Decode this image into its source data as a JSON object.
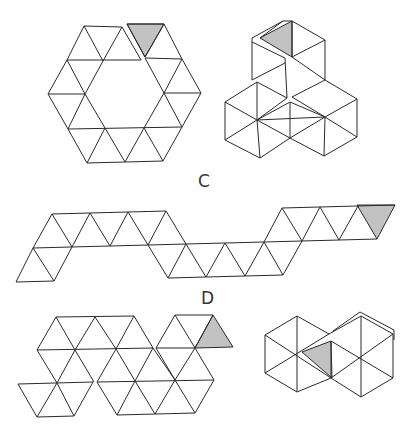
{
  "figure": {
    "labels": {
      "c": "C",
      "d": "D"
    },
    "colors": {
      "line": "#2a2a2a",
      "shaded_face": "#c2c2c2",
      "background": "#ffffff"
    },
    "panels": [
      {
        "id": "C-net",
        "description": "hexagonal ring of 18 equilateral triangles with one shaded triangle at top"
      },
      {
        "id": "C-folded",
        "description": "folded 3D model: three cubes-like rhombic stack with one shaded face"
      },
      {
        "id": "D-net-strip",
        "description": "zigzag strip of equilateral triangles with one shaded triangle at right end"
      },
      {
        "id": "D-net",
        "description": "compact net of triangles forming two hexagon-like clusters with one shaded triangle"
      },
      {
        "id": "D-folded",
        "description": "folded 3D model: two adjoining hexagons with one shaded triangle"
      }
    ]
  }
}
